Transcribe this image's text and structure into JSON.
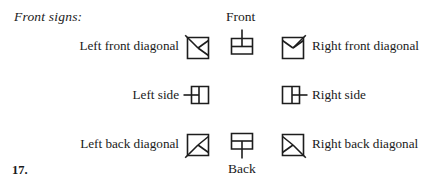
{
  "figure": {
    "caption": "Front signs:",
    "item_number": "17.",
    "orientation_labels": {
      "front": "Front",
      "back": "Back"
    },
    "ink_color": "#1d1d1d",
    "paper_color": "#ffffff"
  },
  "rows": [
    {
      "row_name": "front-diagonal-row",
      "left_label": "Left front diagonal",
      "left_symbol": "square-with-left-front-diagonal",
      "center_label": "Front",
      "center_symbol": "square-with-upward-stem",
      "right_label": "Right front diagonal",
      "right_symbol": "square-with-right-front-diagonal"
    },
    {
      "row_name": "side-row",
      "left_label": "Left side",
      "left_symbol": "square-with-left-stem",
      "center_label": "",
      "center_symbol": "",
      "right_label": "Right side",
      "right_symbol": "square-with-right-stem"
    },
    {
      "row_name": "back-diagonal-row",
      "left_label": "Left back diagonal",
      "left_symbol": "square-with-left-back-diagonal",
      "center_label": "Back",
      "center_symbol": "square-with-downward-stem",
      "right_label": "Right back diagonal",
      "right_symbol": "square-with-right-back-diagonal"
    }
  ]
}
